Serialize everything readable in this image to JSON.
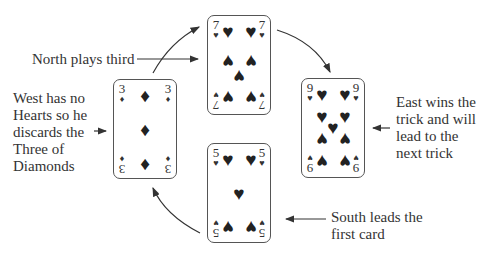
{
  "cards": {
    "north": {
      "rank": "7",
      "suit": "♥",
      "player": "North"
    },
    "west": {
      "rank": "3",
      "suit": "♦",
      "player": "West"
    },
    "east": {
      "rank": "9",
      "suit": "♥",
      "player": "East"
    },
    "south": {
      "rank": "5",
      "suit": "♥",
      "player": "South"
    }
  },
  "labels": {
    "north": "North plays third",
    "west": "West has no\nHearts so he\ndiscards the\nThree of\nDiamonds",
    "east": "East wins the\ntrick and will\nlead to the\nnext trick",
    "south": "South leads the\nfirst card"
  },
  "flow": [
    "South",
    "West",
    "North",
    "East"
  ]
}
